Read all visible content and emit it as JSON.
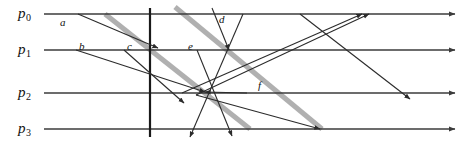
{
  "figure": {
    "kind": "space-time-diagram",
    "width": 465,
    "height": 144,
    "background": "#ffffff"
  },
  "colors": {
    "timeline": "#3b3b3b",
    "message": "#2b2b2b",
    "highlight": "#b0b0b0",
    "cut": "#1a1a1a",
    "text": "#111111"
  },
  "processes": [
    {
      "id": "p0",
      "name": "p",
      "subscript": "0",
      "label_x": 18,
      "label_y": 6,
      "y": 14,
      "x_start": 44,
      "x_end": 455
    },
    {
      "id": "p1",
      "name": "p",
      "subscript": "1",
      "label_x": 18,
      "label_y": 42,
      "y": 50,
      "x_start": 44,
      "x_end": 455
    },
    {
      "id": "p2",
      "name": "p",
      "subscript": "2",
      "label_x": 18,
      "label_y": 85,
      "y": 93,
      "x_start": 44,
      "x_end": 455
    },
    {
      "id": "p3",
      "name": "p",
      "subscript": "3",
      "label_x": 18,
      "label_y": 121,
      "y": 129,
      "x_start": 44,
      "x_end": 455
    }
  ],
  "cut": {
    "x": 150,
    "y_top": 8,
    "y_bottom": 137
  },
  "highlight_lines": [
    {
      "id": "hl1",
      "x1": 105,
      "y1": 14,
      "x2": 250,
      "y2": 129
    },
    {
      "id": "hl2",
      "x1": 175,
      "y1": 7,
      "x2": 322,
      "y2": 129
    }
  ],
  "messages": [
    {
      "id": "a",
      "x1": 78,
      "y1": 14,
      "x2": 158,
      "y2": 48
    },
    {
      "id": "b",
      "x1": 76,
      "y1": 50,
      "x2": 205,
      "y2": 92
    },
    {
      "id": "c",
      "x1": 124,
      "y1": 50,
      "x2": 184,
      "y2": 103
    },
    {
      "id": "d",
      "x1": 212,
      "y1": 8,
      "x2": 229,
      "y2": 50
    },
    {
      "id": "e",
      "x1": 197,
      "y1": 50,
      "x2": 232,
      "y2": 136
    },
    {
      "id": "f",
      "x1": 247,
      "y1": 93,
      "x2": 205,
      "y2": 92
    },
    {
      "id": "m7",
      "x1": 243,
      "y1": 14,
      "x2": 190,
      "y2": 137
    },
    {
      "id": "m8",
      "x1": 182,
      "y1": 93,
      "x2": 362,
      "y2": 14
    },
    {
      "id": "m9",
      "x1": 196,
      "y1": 95,
      "x2": 369,
      "y2": 14
    },
    {
      "id": "m10",
      "x1": 300,
      "y1": 14,
      "x2": 410,
      "y2": 99
    },
    {
      "id": "m11",
      "x1": 196,
      "y1": 95,
      "x2": 320,
      "y2": 129
    }
  ],
  "message_labels": [
    {
      "id": "a",
      "text": "a",
      "x": 60,
      "y": 17
    },
    {
      "id": "b",
      "text": "b",
      "x": 79,
      "y": 41
    },
    {
      "id": "c",
      "text": "c",
      "x": 127,
      "y": 41
    },
    {
      "id": "d",
      "text": "d",
      "x": 219,
      "y": 14
    },
    {
      "id": "e",
      "text": "e",
      "x": 188,
      "y": 41
    },
    {
      "id": "f",
      "text": "f",
      "x": 258,
      "y": 80
    }
  ]
}
